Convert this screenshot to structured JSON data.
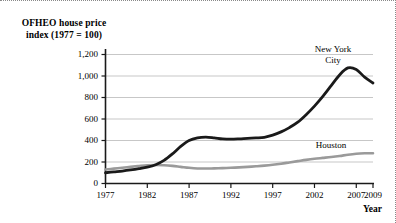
{
  "chart_data": {
    "type": "line",
    "title": "OFHEO house price index (1977 = 100)",
    "title_line1": "OFHEO house price",
    "title_line2": "index (1977 = 100)",
    "xlabel": "Year",
    "ylabel": "",
    "xlim": [
      1977,
      2009
    ],
    "ylim": [
      0,
      1300
    ],
    "grid": true,
    "legend_position": "inline-annotations",
    "x_ticks": [
      1977,
      1982,
      1987,
      1992,
      1997,
      2002,
      2007,
      2009
    ],
    "x_tick_labels": [
      "1977",
      "1982",
      "1987",
      "1992",
      "1997",
      "2002",
      "2007",
      "2009"
    ],
    "y_ticks": [
      0,
      200,
      400,
      600,
      800,
      1000,
      1200
    ],
    "y_tick_labels": [
      "0",
      "200",
      "400",
      "600",
      "800",
      "1,000",
      "1,200"
    ],
    "series": [
      {
        "name": "New York City",
        "label_line1": "New York",
        "label_line2": "City",
        "color": "#1a1a1a",
        "x": [
          1977,
          1978,
          1979,
          1980,
          1981,
          1982,
          1983,
          1984,
          1985,
          1986,
          1987,
          1988,
          1989,
          1990,
          1991,
          1992,
          1993,
          1994,
          1995,
          1996,
          1997,
          1998,
          1999,
          2000,
          2001,
          2002,
          2003,
          2004,
          2005,
          2006,
          2007,
          2008,
          2009
        ],
        "values": [
          100,
          108,
          116,
          126,
          138,
          152,
          175,
          215,
          275,
          345,
          400,
          425,
          432,
          425,
          415,
          412,
          415,
          420,
          424,
          430,
          450,
          480,
          520,
          570,
          640,
          720,
          810,
          910,
          1010,
          1075,
          1060,
          990,
          935
        ]
      },
      {
        "name": "Houston",
        "label_line1": "Houston",
        "color": "#9a9a9a",
        "x": [
          1977,
          1978,
          1979,
          1980,
          1981,
          1982,
          1983,
          1984,
          1985,
          1986,
          1987,
          1988,
          1989,
          1990,
          1991,
          1992,
          1993,
          1994,
          1995,
          1996,
          1997,
          1998,
          1999,
          2000,
          2001,
          2002,
          2003,
          2004,
          2005,
          2006,
          2007,
          2008,
          2009
        ],
        "values": [
          130,
          138,
          146,
          155,
          163,
          170,
          172,
          170,
          164,
          155,
          146,
          140,
          139,
          141,
          143,
          146,
          150,
          155,
          160,
          166,
          174,
          184,
          196,
          208,
          220,
          230,
          238,
          246,
          256,
          268,
          277,
          281,
          282
        ]
      }
    ]
  }
}
